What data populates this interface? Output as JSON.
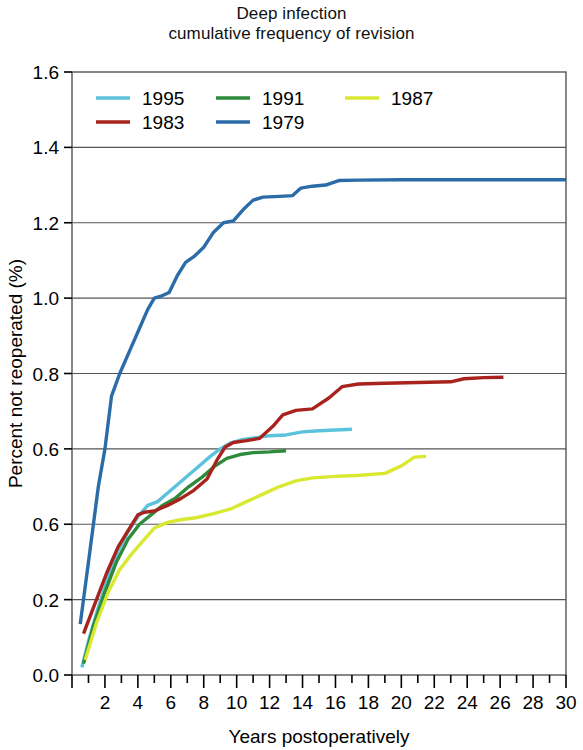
{
  "chart_data": {
    "type": "line",
    "title": "Deep infection\ncumulative frequency of revision",
    "title_lines": [
      "Deep infection",
      "cumulative frequency of revision"
    ],
    "xlabel": "Years postoperatively",
    "ylabel": "Percent not reoperated (%)",
    "xlim": [
      0,
      30
    ],
    "ylim": [
      0.0,
      1.6
    ],
    "grid": true,
    "legend_position": "top-left-inside",
    "x_ticks_major": [
      2,
      4,
      6,
      8,
      10,
      12,
      14,
      16,
      18,
      20,
      22,
      24,
      26,
      28,
      30
    ],
    "x_tick_labels": [
      "2",
      "4",
      "6",
      "8",
      "10",
      "12",
      "14",
      "16",
      "18",
      "20",
      "22",
      "24",
      "26",
      "28",
      "30"
    ],
    "x_ticks_minor": [
      1,
      3,
      5,
      7,
      9,
      11,
      13,
      15,
      17,
      19,
      21,
      23,
      25,
      27,
      29
    ],
    "y_ticks": [
      0.0,
      0.2,
      0.4,
      0.6,
      0.8,
      1.0,
      1.2,
      1.4,
      1.6
    ],
    "y_tick_labels": [
      "0.0",
      "0.2",
      "0.6",
      "0.6",
      "0.8",
      "1.0",
      "1.2",
      "1.4",
      "1.6"
    ],
    "series": [
      {
        "name": "1995",
        "color": "#5BC2DC",
        "points": [
          [
            0.6,
            0.02
          ],
          [
            1.0,
            0.09
          ],
          [
            1.6,
            0.18
          ],
          [
            2.2,
            0.26
          ],
          [
            2.8,
            0.33
          ],
          [
            3.4,
            0.38
          ],
          [
            4.0,
            0.42
          ],
          [
            4.6,
            0.45
          ],
          [
            5.2,
            0.46
          ],
          [
            6.0,
            0.49
          ],
          [
            6.8,
            0.52
          ],
          [
            7.6,
            0.55
          ],
          [
            8.4,
            0.58
          ],
          [
            9.0,
            0.6
          ],
          [
            9.6,
            0.615
          ],
          [
            10.4,
            0.625
          ],
          [
            11.2,
            0.63
          ],
          [
            12.0,
            0.635
          ],
          [
            13.0,
            0.637
          ],
          [
            14.0,
            0.645
          ],
          [
            15.0,
            0.648
          ],
          [
            16.0,
            0.65
          ],
          [
            17.0,
            0.652
          ]
        ]
      },
      {
        "name": "1991",
        "color": "#2E8B3C",
        "points": [
          [
            0.7,
            0.03
          ],
          [
            1.3,
            0.13
          ],
          [
            2.0,
            0.22
          ],
          [
            2.7,
            0.3
          ],
          [
            3.4,
            0.36
          ],
          [
            4.1,
            0.4
          ],
          [
            4.8,
            0.425
          ],
          [
            5.5,
            0.45
          ],
          [
            6.3,
            0.47
          ],
          [
            7.1,
            0.5
          ],
          [
            7.9,
            0.525
          ],
          [
            8.7,
            0.555
          ],
          [
            9.4,
            0.575
          ],
          [
            10.2,
            0.585
          ],
          [
            11.0,
            0.59
          ],
          [
            12.0,
            0.592
          ],
          [
            13.0,
            0.595
          ]
        ]
      },
      {
        "name": "1987",
        "color": "#D9E830",
        "points": [
          [
            0.8,
            0.04
          ],
          [
            1.5,
            0.14
          ],
          [
            2.2,
            0.22
          ],
          [
            2.9,
            0.28
          ],
          [
            3.6,
            0.32
          ],
          [
            4.3,
            0.355
          ],
          [
            5.0,
            0.39
          ],
          [
            5.8,
            0.405
          ],
          [
            6.6,
            0.412
          ],
          [
            7.6,
            0.418
          ],
          [
            8.6,
            0.428
          ],
          [
            9.6,
            0.44
          ],
          [
            10.6,
            0.46
          ],
          [
            11.6,
            0.48
          ],
          [
            12.6,
            0.5
          ],
          [
            13.6,
            0.515
          ],
          [
            14.6,
            0.523
          ],
          [
            16.0,
            0.527
          ],
          [
            17.5,
            0.53
          ],
          [
            19.0,
            0.535
          ],
          [
            20.0,
            0.555
          ],
          [
            20.8,
            0.578
          ],
          [
            21.5,
            0.58
          ]
        ]
      },
      {
        "name": "1983",
        "color": "#A8231E",
        "points": [
          [
            0.7,
            0.11
          ],
          [
            1.4,
            0.19
          ],
          [
            2.1,
            0.27
          ],
          [
            2.8,
            0.34
          ],
          [
            3.5,
            0.39
          ],
          [
            4.0,
            0.425
          ],
          [
            4.4,
            0.432
          ],
          [
            5.0,
            0.435
          ],
          [
            5.8,
            0.45
          ],
          [
            6.6,
            0.468
          ],
          [
            7.4,
            0.49
          ],
          [
            8.2,
            0.52
          ],
          [
            8.8,
            0.57
          ],
          [
            9.3,
            0.605
          ],
          [
            9.8,
            0.617
          ],
          [
            10.6,
            0.622
          ],
          [
            11.4,
            0.628
          ],
          [
            12.2,
            0.66
          ],
          [
            12.8,
            0.69
          ],
          [
            13.6,
            0.702
          ],
          [
            14.6,
            0.706
          ],
          [
            15.6,
            0.735
          ],
          [
            16.4,
            0.765
          ],
          [
            17.4,
            0.772
          ],
          [
            19.0,
            0.774
          ],
          [
            21.0,
            0.776
          ],
          [
            23.0,
            0.778
          ],
          [
            23.8,
            0.786
          ],
          [
            25.0,
            0.789
          ],
          [
            26.2,
            0.79
          ]
        ]
      },
      {
        "name": "1979",
        "color": "#2B6CA8",
        "points": [
          [
            0.5,
            0.135
          ],
          [
            1.0,
            0.3
          ],
          [
            1.6,
            0.5
          ],
          [
            2.0,
            0.6
          ],
          [
            2.4,
            0.74
          ],
          [
            2.9,
            0.8
          ],
          [
            3.5,
            0.86
          ],
          [
            4.1,
            0.92
          ],
          [
            4.6,
            0.97
          ],
          [
            5.0,
            1.0
          ],
          [
            5.4,
            1.005
          ],
          [
            5.9,
            1.015
          ],
          [
            6.4,
            1.06
          ],
          [
            6.9,
            1.095
          ],
          [
            7.4,
            1.11
          ],
          [
            8.0,
            1.135
          ],
          [
            8.6,
            1.175
          ],
          [
            9.2,
            1.2
          ],
          [
            9.8,
            1.205
          ],
          [
            10.4,
            1.235
          ],
          [
            11.0,
            1.26
          ],
          [
            11.6,
            1.268
          ],
          [
            12.6,
            1.27
          ],
          [
            13.4,
            1.272
          ],
          [
            13.9,
            1.292
          ],
          [
            14.6,
            1.297
          ],
          [
            15.4,
            1.3
          ],
          [
            16.2,
            1.312
          ],
          [
            17.4,
            1.313
          ],
          [
            20.0,
            1.314
          ],
          [
            24.0,
            1.314
          ],
          [
            27.0,
            1.314
          ],
          [
            30.0,
            1.314
          ]
        ]
      }
    ],
    "legend_entries": [
      {
        "label": "1995",
        "color": "#5BC2DC"
      },
      {
        "label": "1991",
        "color": "#2E8B3C"
      },
      {
        "label": "1987",
        "color": "#D9E830"
      },
      {
        "label": "1983",
        "color": "#A8231E"
      },
      {
        "label": "1979",
        "color": "#2B6CA8"
      }
    ]
  }
}
